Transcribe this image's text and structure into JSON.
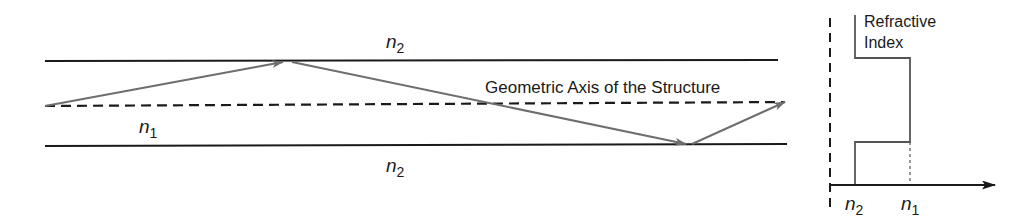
{
  "figure": {
    "type": "step-index slab waveguide ray diagram",
    "colors": {
      "boundary": "#1a1a1a",
      "axis": "#1a1a1a",
      "ray": "#6e6e6e",
      "background": "#ffffff"
    }
  },
  "waveguide": {
    "top_cladding_label": {
      "symbol": "n",
      "subscript": "2"
    },
    "core_label": {
      "symbol": "n",
      "subscript": "1"
    },
    "bottom_cladding_label": {
      "symbol": "n",
      "subscript": "2"
    },
    "axis_label": "Geometric Axis of the Structure",
    "ray_path_points": [
      [
        45,
        106
      ],
      [
        287,
        61
      ],
      [
        690,
        145
      ],
      [
        785,
        102
      ]
    ]
  },
  "profile_inset": {
    "title_line1": "Refractive",
    "title_line2": "Index",
    "tick_left": {
      "symbol": "n",
      "subscript": "2"
    },
    "tick_right": {
      "symbol": "n",
      "subscript": "1"
    }
  }
}
